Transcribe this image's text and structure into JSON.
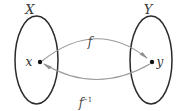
{
  "figure": {
    "kind": "set-mapping-diagram",
    "background_color": "#ffffff",
    "sets": [
      {
        "id": "domain",
        "label": "X",
        "shape": "ellipse",
        "center": [
          36.5,
          60
        ],
        "radius_x": 21.5,
        "radius_y": 44,
        "stroke_color": "#2b2b2b",
        "label_position": [
          30,
          13
        ]
      },
      {
        "id": "codomain",
        "label": "Y",
        "shape": "ellipse",
        "center": [
          151,
          60
        ],
        "radius_x": 21,
        "radius_y": 44,
        "stroke_color": "#2b2b2b",
        "label_position": [
          146,
          13
        ]
      }
    ],
    "points": [
      {
        "id": "x-point",
        "label": "x",
        "position": [
          40,
          62
        ],
        "label_position": [
          29,
          66
        ],
        "dot_color": "#111111",
        "in_set": "X"
      },
      {
        "id": "y-point",
        "label": "y",
        "position": [
          152,
          62
        ],
        "label_position": [
          158,
          66
        ],
        "dot_color": "#111111",
        "in_set": "Y"
      }
    ],
    "arrows": [
      {
        "id": "forward-map",
        "label": "f",
        "label_sup": "",
        "from": "x-point",
        "to": "y-point",
        "direction": "x-to-y",
        "curve": "arc-above",
        "stroke_color": "#9a9a9a",
        "label_position": [
          90,
          42
        ]
      },
      {
        "id": "inverse-map",
        "label": "f",
        "label_sup": "−1",
        "from": "y-point",
        "to": "x-point",
        "direction": "y-to-x",
        "curve": "arc-below",
        "stroke_color": "#9a9a9a",
        "label_position": [
          84,
          103
        ]
      }
    ]
  }
}
